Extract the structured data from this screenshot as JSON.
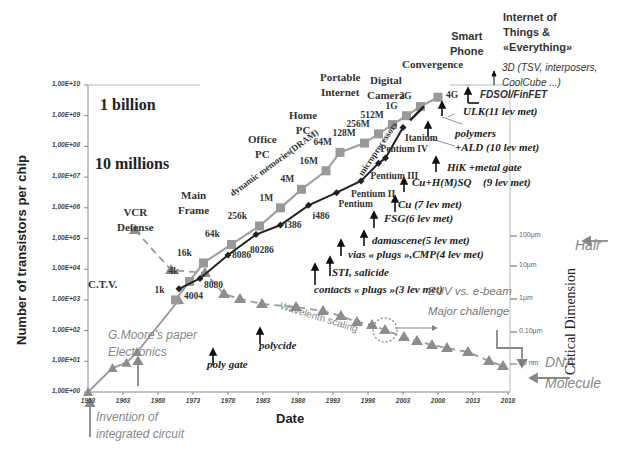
{
  "chart_data": {
    "type": "line",
    "title": "",
    "xlabel": "Date",
    "ylabel": "Number of transistors per chip",
    "y2label": "Critical Dimension",
    "yscale": "log",
    "ylim": [
      1,
      10000000000
    ],
    "xlim": [
      1958,
      2018
    ],
    "x_ticks": [
      "1958",
      "1963",
      "1968",
      "1973",
      "1978",
      "1983",
      "1988",
      "1993",
      "1998",
      "2003",
      "2008",
      "2013",
      "2018"
    ],
    "y_ticks": [
      "1,00E+00",
      "1,00E+01",
      "1,00E+02",
      "1,00E+03",
      "1,00E+04",
      "1,00E+05",
      "1,00E+06",
      "1,00E+07",
      "1,00E+08",
      "1,00E+09",
      "1,00E+10"
    ],
    "y2_ticks": [
      {
        "label": "100µm",
        "y": 236
      },
      {
        "label": "10µm",
        "y": 266
      },
      {
        "label": "1µm",
        "y": 299
      },
      {
        "label": "0,10µm",
        "y": 332
      },
      {
        "label": "10 nm",
        "y": 364
      }
    ],
    "grid": false,
    "series": [
      {
        "name": "dynamic memories(DRAM)",
        "color": "#9a9a9a",
        "marker": "square",
        "points": [
          {
            "year": 1958,
            "value": 1,
            "label": ""
          },
          {
            "year": 1970.5,
            "value": 1000,
            "label": "1k"
          },
          {
            "year": 1972.5,
            "value": 4000,
            "label": "4k"
          },
          {
            "year": 1974.5,
            "value": 16000,
            "label": "16k"
          },
          {
            "year": 1978.5,
            "value": 64000,
            "label": "64k"
          },
          {
            "year": 1982.5,
            "value": 256000,
            "label": "256k"
          },
          {
            "year": 1985.5,
            "value": 1000000,
            "label": "1M"
          },
          {
            "year": 1988.5,
            "value": 4000000,
            "label": "4M"
          },
          {
            "year": 1992,
            "value": 16000000,
            "label": "16M"
          },
          {
            "year": 1994,
            "value": 64000000,
            "label": "64M"
          },
          {
            "year": 1997.5,
            "value": 128000000,
            "label": "128M"
          },
          {
            "year": 1999.5,
            "value": 256000000,
            "label": "256M"
          },
          {
            "year": 2001.5,
            "value": 512000000,
            "label": "512M"
          },
          {
            "year": 2003.5,
            "value": 1000000000,
            "label": "1G"
          },
          {
            "year": 2005.5,
            "value": 2000000000,
            "label": "2G"
          },
          {
            "year": 2008,
            "value": 4000000000,
            "label": "4G"
          }
        ]
      },
      {
        "name": "microprocessors",
        "color": "#222222",
        "marker": "diamond",
        "points": [
          {
            "year": 1971,
            "value": 2300,
            "label": "4004"
          },
          {
            "year": 1974,
            "value": 5000,
            "label": "8080"
          },
          {
            "year": 1978,
            "value": 29000,
            "label": "8086"
          },
          {
            "year": 1982,
            "value": 134000,
            "label": "80286"
          },
          {
            "year": 1985.5,
            "value": 275000,
            "label": "i386"
          },
          {
            "year": 1989.5,
            "value": 1200000,
            "label": "i486"
          },
          {
            "year": 1993.5,
            "value": 3100000,
            "label": "Pentium"
          },
          {
            "year": 1997,
            "value": 7500000,
            "label": "Pentium II"
          },
          {
            "year": 1999.5,
            "value": 28000000,
            "label": "Pentium III"
          },
          {
            "year": 2000.5,
            "value": 42000000,
            "label": "Pentium IV"
          },
          {
            "year": 2003,
            "value": 410000000,
            "label": "Itanium"
          },
          {
            "year": 2005.5,
            "value": 1700000000,
            "label": ""
          }
        ]
      },
      {
        "name": "Critical dimension (Wavelenth scaling)",
        "color": "#9a9a9a",
        "marker": "triangle",
        "dashed": true,
        "points": [
          {
            "x": 135,
            "y": 230
          },
          {
            "x": 171,
            "y": 270
          },
          {
            "x": 205,
            "y": 273
          },
          {
            "x": 224,
            "y": 294
          },
          {
            "x": 240,
            "y": 299
          },
          {
            "x": 262,
            "y": 304
          },
          {
            "x": 296,
            "y": 307
          },
          {
            "x": 323,
            "y": 311
          },
          {
            "x": 341,
            "y": 316
          },
          {
            "x": 357,
            "y": 322
          },
          {
            "x": 372,
            "y": 325
          },
          {
            "x": 385,
            "y": 330
          },
          {
            "x": 404,
            "y": 337
          },
          {
            "x": 417,
            "y": 341
          },
          {
            "x": 432,
            "y": 345
          },
          {
            "x": 447,
            "y": 348
          },
          {
            "x": 468,
            "y": 352
          },
          {
            "x": 489,
            "y": 361
          },
          {
            "x": 503,
            "y": 366
          }
        ]
      }
    ],
    "annotations": {
      "eras": [
        {
          "text": [
            "C.T.V."
          ],
          "x": 88,
          "y": 277
        },
        {
          "text": [
            "VCR",
            "Defense"
          ],
          "x": 117,
          "y": 205
        },
        {
          "text": [
            "Main",
            "Frame"
          ],
          "x": 178,
          "y": 188
        },
        {
          "text": [
            "Office",
            "PC"
          ],
          "x": 248,
          "y": 132
        },
        {
          "text": [
            "Home",
            "PC"
          ],
          "x": 289,
          "y": 108
        },
        {
          "text": [
            "Portable",
            "Internet"
          ],
          "x": 320,
          "y": 70
        },
        {
          "text": [
            "Digital",
            "Camera"
          ],
          "x": 367,
          "y": 73
        },
        {
          "text": [
            "Convergence"
          ],
          "x": 402,
          "y": 57
        },
        {
          "text": [
            "Smart",
            "Phone"
          ],
          "x": 450,
          "y": 29
        },
        {
          "text": [
            "Internet of",
            "Things &",
            "«Everything»"
          ],
          "x": 503,
          "y": 10
        }
      ],
      "scale_labels": [
        {
          "text": "1 billion",
          "x": 100,
          "y": 106
        },
        {
          "text": "10 millions",
          "x": 95,
          "y": 165
        }
      ],
      "technology": [
        {
          "text": "3D (TSV, interposers,",
          "x": 502,
          "y": 69,
          "style": "sans"
        },
        {
          "text": "CoolCube ...)",
          "x": 502,
          "y": 84,
          "style": "sans"
        },
        {
          "text": "FDSOI/FinFET",
          "x": 480,
          "y": 96,
          "style": "sans"
        },
        {
          "text": "ULK(11 lev met)",
          "x": 463,
          "y": 112
        },
        {
          "text": "polymers",
          "x": 455,
          "y": 134
        },
        {
          "text": "+ALD (10 lev met)",
          "x": 455,
          "y": 148
        },
        {
          "text": "HiK +metal gate",
          "x": 447,
          "y": 168
        },
        {
          "text": "Cu+H(M)SQ",
          "x": 412,
          "y": 183
        },
        {
          "text": "(9 lev met)",
          "x": 483,
          "y": 183
        },
        {
          "text": "Cu (7 lev met)",
          "x": 398,
          "y": 205
        },
        {
          "text": "FSG(6 lev met)",
          "x": 384,
          "y": 219
        },
        {
          "text": "damascene(5 lev met)",
          "x": 372,
          "y": 241
        },
        {
          "text": "vias « plugs »,CMP(4 lev met)",
          "x": 348,
          "y": 255
        },
        {
          "text": "STI, salicide",
          "x": 332,
          "y": 273
        },
        {
          "text": "contacts « plugs »(3 lev met)",
          "x": 314,
          "y": 290
        },
        {
          "text": "polycide",
          "x": 259,
          "y": 346
        },
        {
          "text": "poly gate",
          "x": 207,
          "y": 365
        }
      ],
      "notes": [
        {
          "text": "G.Moore's paper",
          "x": 108,
          "y": 336
        },
        {
          "text": "Electronics",
          "x": 108,
          "y": 353
        },
        {
          "text": "Invention of",
          "x": 96,
          "y": 418
        },
        {
          "text": "integrated circuit",
          "x": 96,
          "y": 435
        },
        {
          "text": "EUV vs. e-beam",
          "x": 428,
          "y": 293
        },
        {
          "text": "Major challenge",
          "x": 428,
          "y": 313
        },
        {
          "text": "Hair",
          "x": 575,
          "y": 245
        },
        {
          "text": "DNA",
          "x": 545,
          "y": 362
        },
        {
          "text": "Molecule",
          "x": 545,
          "y": 383
        }
      ],
      "rotated": [
        {
          "text": "dynamic memories(DRAM)",
          "x": 228,
          "y": 190
        },
        {
          "text": "microprocessors",
          "x": 356,
          "y": 172
        },
        {
          "text": "Wavelenth scaling",
          "x": 282,
          "y": 300
        }
      ]
    }
  }
}
